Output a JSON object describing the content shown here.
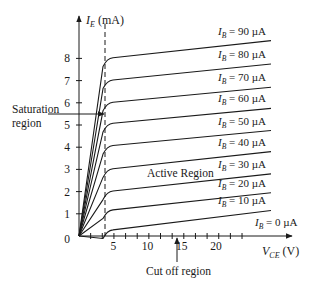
{
  "chart_data": {
    "type": "line",
    "title": "",
    "xlabel": "V_CE (V)",
    "ylabel": "I_E (mA)",
    "xlim": [
      0,
      28
    ],
    "ylim": [
      0,
      9
    ],
    "x_ticks": [
      5,
      10,
      15,
      20
    ],
    "y_ticks": [
      0,
      1,
      2,
      3,
      4,
      5,
      6,
      7,
      8
    ],
    "grid": false,
    "legend": "inline labels at right end of each curve",
    "saturation_boundary_vce": 2,
    "series": [
      {
        "name": "I_B = 90 µA",
        "knee": [
          2.2,
          8.0
        ],
        "end": [
          26,
          8.8
        ],
        "label": "I",
        "sub": "B",
        "rest": " = 90 µA"
      },
      {
        "name": "I_B = 80 µA",
        "knee": [
          2.2,
          7.0
        ],
        "end": [
          26,
          7.75
        ],
        "label": "I",
        "sub": "B",
        "rest": " = 80 µA"
      },
      {
        "name": "I_B = 70 µA",
        "knee": [
          2.2,
          6.0
        ],
        "end": [
          26,
          6.7
        ],
        "label": "I",
        "sub": "B",
        "rest": " = 70 µA"
      },
      {
        "name": "I_B = 60 µA",
        "knee": [
          2.2,
          5.05
        ],
        "end": [
          26,
          5.75
        ],
        "label": "I",
        "sub": "B",
        "rest": " = 60 µA"
      },
      {
        "name": "I_B = 50 µA",
        "knee": [
          2.2,
          4.05
        ],
        "end": [
          26,
          4.75
        ],
        "label": "I",
        "sub": "B",
        "rest": " = 50 µA"
      },
      {
        "name": "I_B = 40 µA",
        "knee": [
          2.2,
          3.0
        ],
        "end": [
          26,
          3.8
        ],
        "label": "I",
        "sub": "B",
        "rest": " = 40 µA"
      },
      {
        "name": "I_B = 30 µA",
        "knee": [
          2.2,
          2.0
        ],
        "end": [
          26,
          2.8
        ],
        "label": "I",
        "sub": "B",
        "rest": " = 30 µA"
      },
      {
        "name": "I_B = 20 µA",
        "knee": [
          2.2,
          1.15
        ],
        "end": [
          26,
          1.95
        ],
        "label": "I",
        "sub": "B",
        "rest": " = 20 µA"
      },
      {
        "name": "I_B = 10 µA",
        "knee": [
          2.2,
          0.25
        ],
        "end": [
          26,
          1.15
        ],
        "label": "I",
        "sub": "B",
        "rest": " = 10 µA"
      }
    ],
    "cutoff_label": {
      "label": "I",
      "sub": "B",
      "rest": " = 0 µA"
    },
    "annotations": [
      {
        "text": "Saturation region",
        "lines": [
          "Saturation",
          "region"
        ]
      },
      {
        "text": "Active Region"
      },
      {
        "text": "Cut off region"
      }
    ]
  },
  "axis_labels": {
    "y_main": "I",
    "y_sub": "E",
    "y_unit": " (mA)",
    "x_main": "V",
    "x_sub": "CE",
    "x_unit": " (V)"
  },
  "annotations": {
    "saturation_line1": "Saturation",
    "saturation_line2": "region",
    "active": "Active Region",
    "cutoff": "Cut off region"
  }
}
